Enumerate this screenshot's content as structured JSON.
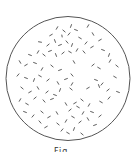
{
  "figure": {
    "type": "microscope-field-view",
    "circle": {
      "cx": 68,
      "cy": 78.5,
      "r": 62,
      "stroke": "#555555",
      "stroke_width": 1
    },
    "particle_color": "#333333",
    "particles": [
      [
        57,
        28,
        3,
        -60
      ],
      [
        64,
        31,
        3,
        40
      ],
      [
        71,
        26,
        3,
        -70
      ],
      [
        51,
        35,
        3,
        -30
      ],
      [
        62,
        36,
        2,
        80
      ],
      [
        69,
        34,
        3,
        -50
      ],
      [
        76,
        30,
        3,
        20
      ],
      [
        88,
        26,
        3,
        -60
      ],
      [
        40,
        42,
        3,
        10
      ],
      [
        48,
        45,
        3,
        -40
      ],
      [
        55,
        41,
        3,
        70
      ],
      [
        60,
        45,
        3,
        -20
      ],
      [
        67,
        42,
        3,
        50
      ],
      [
        72,
        45,
        3,
        -70
      ],
      [
        80,
        38,
        3,
        30
      ],
      [
        86,
        43,
        3,
        -50
      ],
      [
        93,
        34,
        3,
        60
      ],
      [
        100,
        40,
        3,
        -30
      ],
      [
        30,
        55,
        3,
        20
      ],
      [
        38,
        52,
        3,
        -60
      ],
      [
        44,
        55,
        3,
        40
      ],
      [
        50,
        51,
        3,
        -20
      ],
      [
        56,
        55,
        3,
        70
      ],
      [
        63,
        53,
        3,
        -40
      ],
      [
        70,
        52,
        3,
        30
      ],
      [
        77,
        50,
        3,
        -60
      ],
      [
        84,
        52,
        3,
        50
      ],
      [
        92,
        47,
        3,
        -30
      ],
      [
        103,
        50,
        3,
        20
      ],
      [
        109,
        55,
        3,
        -70
      ],
      [
        20,
        62,
        3,
        60
      ],
      [
        26,
        65,
        3,
        -30
      ],
      [
        35,
        63,
        3,
        20
      ],
      [
        42,
        69,
        3,
        -60
      ],
      [
        52,
        66,
        3,
        40
      ],
      [
        60,
        70,
        3,
        -20
      ],
      [
        74,
        62,
        3,
        60
      ],
      [
        93,
        65,
        3,
        -40
      ],
      [
        99,
        68,
        3,
        30
      ],
      [
        110,
        61,
        3,
        -60
      ],
      [
        117,
        66,
        3,
        40
      ],
      [
        18,
        75,
        3,
        -50
      ],
      [
        26,
        78,
        3,
        20
      ],
      [
        34,
        80,
        3,
        -70
      ],
      [
        40,
        76,
        3,
        30
      ],
      [
        48,
        80,
        3,
        -40
      ],
      [
        58,
        83,
        3,
        60
      ],
      [
        66,
        79,
        3,
        -20
      ],
      [
        72,
        75,
        3,
        50
      ],
      [
        72,
        84,
        3,
        -60
      ],
      [
        96,
        80,
        3,
        20
      ],
      [
        102,
        84,
        3,
        -50
      ],
      [
        115,
        77,
        3,
        30
      ],
      [
        22,
        88,
        3,
        40
      ],
      [
        30,
        92,
        3,
        -30
      ],
      [
        38,
        88,
        3,
        60
      ],
      [
        47,
        92,
        3,
        -40
      ],
      [
        55,
        95,
        3,
        20
      ],
      [
        60,
        90,
        3,
        -70
      ],
      [
        71,
        89,
        3,
        40
      ],
      [
        88,
        88,
        3,
        -30
      ],
      [
        99,
        86,
        3,
        70
      ],
      [
        108,
        90,
        3,
        -40
      ],
      [
        118,
        92,
        3,
        20
      ],
      [
        20,
        100,
        3,
        -60
      ],
      [
        27,
        104,
        3,
        30
      ],
      [
        35,
        98,
        3,
        -40
      ],
      [
        44,
        101,
        3,
        50
      ],
      [
        52,
        99,
        3,
        -20
      ],
      [
        66,
        104,
        3,
        60
      ],
      [
        75,
        103,
        3,
        -30
      ],
      [
        82,
        100,
        3,
        40
      ],
      [
        89,
        105,
        3,
        -60
      ],
      [
        101,
        102,
        3,
        30
      ],
      [
        109,
        98,
        3,
        -50
      ],
      [
        25,
        112,
        3,
        20
      ],
      [
        33,
        116,
        3,
        -50
      ],
      [
        42,
        112,
        3,
        40
      ],
      [
        49,
        117,
        3,
        -30
      ],
      [
        57,
        113,
        3,
        60
      ],
      [
        70,
        110,
        3,
        -40
      ],
      [
        78,
        107,
        3,
        30
      ],
      [
        83,
        113,
        3,
        -60
      ],
      [
        92,
        112,
        3,
        20
      ],
      [
        100,
        116,
        3,
        -40
      ],
      [
        40,
        122,
        3,
        50
      ],
      [
        46,
        127,
        3,
        -30
      ],
      [
        58,
        124,
        3,
        40
      ],
      [
        66,
        121,
        3,
        -60
      ],
      [
        73,
        117,
        3,
        30
      ],
      [
        80,
        122,
        3,
        -40
      ],
      [
        88,
        119,
        3,
        60
      ],
      [
        95,
        125,
        3,
        -20
      ],
      [
        62,
        130,
        3,
        -50
      ],
      [
        68,
        133,
        3,
        30
      ],
      [
        74,
        129,
        3,
        -70
      ],
      [
        82,
        134,
        3,
        40
      ]
    ]
  },
  "caption": {
    "text": "Fig. ..."
  }
}
